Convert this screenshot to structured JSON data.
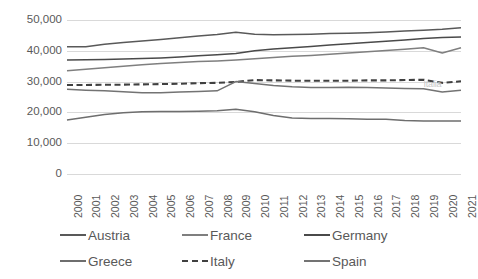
{
  "chart_data": {
    "type": "line",
    "title": "",
    "xlabel": "",
    "ylabel": "",
    "ylim": [
      0,
      50000
    ],
    "ytick_step": 10000,
    "ytick_labels": [
      "50,000",
      "40,000",
      "30,000",
      "20,000",
      "10,000",
      "0"
    ],
    "ytick_values": [
      50000,
      40000,
      30000,
      20000,
      10000,
      0
    ],
    "grid": true,
    "grid_axis": "y",
    "legend_position": "bottom",
    "x": [
      2000,
      2001,
      2002,
      2003,
      2004,
      2005,
      2006,
      2007,
      2008,
      2009,
      2010,
      2011,
      2012,
      2013,
      2014,
      2015,
      2016,
      2017,
      2018,
      2019,
      2020,
      2021
    ],
    "categories": [
      "2000",
      "2001",
      "2002",
      "2003",
      "2004",
      "2005",
      "2006",
      "2007",
      "2008",
      "2009",
      "2010",
      "2011",
      "2012",
      "2013",
      "2014",
      "2015",
      "2016",
      "2017",
      "2018",
      "2019",
      "2020",
      "2021"
    ],
    "series": [
      {
        "name": "Austria",
        "style": "solid",
        "color": "#595959",
        "values": [
          41300,
          41300,
          42100,
          42700,
          43200,
          43700,
          44200,
          44800,
          45300,
          46000,
          45400,
          45200,
          45300,
          45400,
          45600,
          45700,
          45900,
          46100,
          46400,
          46700,
          47000,
          47500
        ]
      },
      {
        "name": "France",
        "style": "solid",
        "color": "#7f7f7f",
        "values": [
          33500,
          34000,
          34500,
          35000,
          35500,
          35900,
          36200,
          36500,
          36700,
          37000,
          37400,
          37800,
          38200,
          38500,
          38900,
          39300,
          39700,
          40100,
          40500,
          41000,
          39300,
          41000
        ]
      },
      {
        "name": "Germany",
        "style": "solid",
        "color": "#4a4a4a",
        "values": [
          37000,
          37100,
          37200,
          37300,
          37500,
          37700,
          38000,
          38400,
          38700,
          39100,
          40000,
          40600,
          41000,
          41400,
          41900,
          42300,
          42700,
          43100,
          43500,
          44000,
          44300,
          44500
        ]
      },
      {
        "name": "Greece",
        "style": "solid",
        "color": "#6e6e6e",
        "values": [
          17500,
          18400,
          19300,
          19900,
          20200,
          20300,
          20300,
          20400,
          20500,
          21000,
          20200,
          19000,
          18200,
          18000,
          18000,
          17900,
          17800,
          17800,
          17400,
          17200,
          17200,
          17200
        ]
      },
      {
        "name": "Italy",
        "style": "dashed",
        "color": "#404040",
        "values": [
          28900,
          28900,
          29000,
          29000,
          29100,
          29200,
          29300,
          29500,
          29600,
          29900,
          30500,
          30400,
          30300,
          30300,
          30300,
          30300,
          30400,
          30400,
          30500,
          30600,
          29600,
          30100
        ]
      },
      {
        "name": "Spain",
        "style": "solid",
        "color": "#737373",
        "values": [
          27500,
          27200,
          27000,
          26700,
          26400,
          26400,
          26600,
          26800,
          27000,
          30000,
          29400,
          28700,
          28300,
          28100,
          28100,
          28200,
          28100,
          27900,
          27800,
          27700,
          26600,
          27200
        ]
      }
    ]
  },
  "legend": {
    "rows": [
      [
        {
          "label": "Austria",
          "style": "solid",
          "color": "#595959"
        },
        {
          "label": "France",
          "style": "solid",
          "color": "#7f7f7f"
        },
        {
          "label": "Germany",
          "style": "solid",
          "color": "#4a4a4a"
        }
      ],
      [
        {
          "label": "Greece",
          "style": "solid",
          "color": "#6e6e6e"
        },
        {
          "label": "Italy",
          "style": "dashed",
          "color": "#404040"
        },
        {
          "label": "Spain",
          "style": "solid",
          "color": "#737373"
        }
      ]
    ]
  },
  "annotations": [
    {
      "text": "Italia",
      "x": 2019,
      "y": 29200,
      "color": "#c7c7c7"
    }
  ]
}
